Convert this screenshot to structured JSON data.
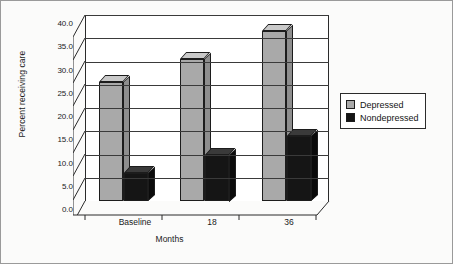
{
  "chart_data": {
    "type": "bar",
    "title": "",
    "xlabel": "Months",
    "ylabel": "Percent receiving care",
    "categories": [
      "Baseline",
      "18",
      "36"
    ],
    "series": [
      {
        "name": "Depressed",
        "values": [
          25.5,
          30.5,
          36.5
        ],
        "color": "#a9a9a9"
      },
      {
        "name": "Nondepressed",
        "values": [
          6.0,
          10.0,
          14.0
        ],
        "color": "#151515"
      }
    ],
    "ylim": [
      0.0,
      40.0
    ],
    "yticks": [
      "0.0",
      "5.0",
      "10.0",
      "15.0",
      "20.0",
      "25.0",
      "30.0",
      "35.0",
      "40.0"
    ],
    "ytick_values": [
      0,
      5,
      10,
      15,
      20,
      25,
      30,
      35,
      40
    ],
    "grid": true,
    "legend_position": "right",
    "style": "3d-column"
  },
  "legend": {
    "items": [
      {
        "label": "Depressed",
        "swatch": "gray-swatch"
      },
      {
        "label": "Nondepressed",
        "swatch": "black-swatch"
      }
    ]
  }
}
